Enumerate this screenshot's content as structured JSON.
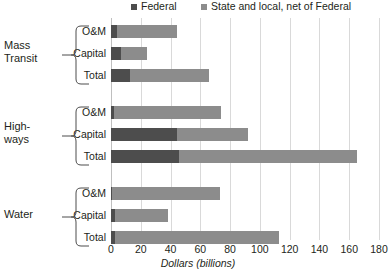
{
  "legend": {
    "items": [
      {
        "label": "Federal",
        "color": "#4d4d4d",
        "key": "federal"
      },
      {
        "label": "State and local, net of Federal",
        "color": "#8c8c8c",
        "key": "statelocal"
      }
    ]
  },
  "axis": {
    "title": "Dollars (billions)",
    "ticks": [
      "0",
      "20",
      "40",
      "60",
      "80",
      "100",
      "120",
      "140",
      "160",
      "180"
    ]
  },
  "groups": [
    {
      "name": "Mass Transit",
      "line1": "Mass",
      "line2": "Transit"
    },
    {
      "name": "Highways",
      "line1": "High-",
      "line2": "ways"
    },
    {
      "name": "Water",
      "line1": "Water",
      "line2": ""
    }
  ],
  "subcategories": [
    "O&M",
    "Capital",
    "Total"
  ],
  "chart_data": {
    "type": "bar",
    "orientation": "horizontal",
    "stacked": true,
    "title": "",
    "xlabel": "Dollars (billions)",
    "ylabel": "",
    "xlim": [
      0,
      180
    ],
    "xticks": [
      0,
      20,
      40,
      60,
      80,
      100,
      120,
      140,
      160,
      180
    ],
    "grid": "vertical",
    "legend_position": "top",
    "series": [
      {
        "name": "Federal",
        "color": "#4d4d4d"
      },
      {
        "name": "State and local, net of Federal",
        "color": "#8c8c8c"
      }
    ],
    "categories": [
      "Mass Transit - O&M",
      "Mass Transit - Capital",
      "Mass Transit - Total",
      "Highways - O&M",
      "Highways - Capital",
      "Highways - Total",
      "Water - O&M",
      "Water - Capital",
      "Water - Total"
    ],
    "rows": [
      {
        "group": "Mass Transit",
        "sub": "O&M",
        "federal": 4,
        "statelocal": 40,
        "total": 44
      },
      {
        "group": "Mass Transit",
        "sub": "Capital",
        "federal": 7,
        "statelocal": 17,
        "total": 24
      },
      {
        "group": "Mass Transit",
        "sub": "Total",
        "federal": 13,
        "statelocal": 53,
        "total": 66
      },
      {
        "group": "Highways",
        "sub": "O&M",
        "federal": 2,
        "statelocal": 72,
        "total": 74
      },
      {
        "group": "Highways",
        "sub": "Capital",
        "federal": 44,
        "statelocal": 48,
        "total": 92
      },
      {
        "group": "Highways",
        "sub": "Total",
        "federal": 46,
        "statelocal": 119,
        "total": 165
      },
      {
        "group": "Water",
        "sub": "O&M",
        "federal": 1,
        "statelocal": 72,
        "total": 73
      },
      {
        "group": "Water",
        "sub": "Capital",
        "federal": 3,
        "statelocal": 35,
        "total": 38
      },
      {
        "group": "Water",
        "sub": "Total",
        "federal": 3,
        "statelocal": 110,
        "total": 113
      }
    ]
  }
}
